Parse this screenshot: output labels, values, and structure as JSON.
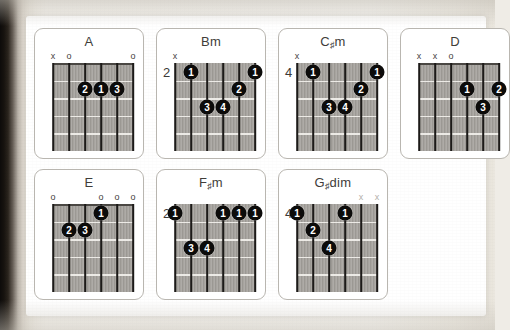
{
  "page": {
    "kind": "guitar-chord-chart-scan",
    "paper_color": "#fcfbf8",
    "ink_color": "#0c0b0a",
    "fretboard_color": "#a3a09b"
  },
  "chords": [
    {
      "id": "a",
      "name": "A",
      "root": "A",
      "accidental": "",
      "suffix": "",
      "start_fret": null,
      "start_fret_label": "",
      "frets": 5,
      "strings": 6,
      "open_markers": [
        {
          "string": 6,
          "symbol": "x",
          "faint": false
        },
        {
          "string": 5,
          "symbol": "o",
          "faint": false
        },
        {
          "string": 1,
          "symbol": "o",
          "faint": false
        }
      ],
      "fingers": [
        {
          "string": 4,
          "fret": 2,
          "finger": "2"
        },
        {
          "string": 3,
          "fret": 2,
          "finger": "1"
        },
        {
          "string": 2,
          "fret": 2,
          "finger": "3"
        }
      ]
    },
    {
      "id": "bm",
      "name": "Bm",
      "root": "B",
      "accidental": "",
      "suffix": "m",
      "start_fret": 2,
      "start_fret_label": "2",
      "frets": 5,
      "strings": 6,
      "open_markers": [
        {
          "string": 6,
          "symbol": "x",
          "faint": false
        }
      ],
      "fingers": [
        {
          "string": 5,
          "fret": 1,
          "finger": "1"
        },
        {
          "string": 1,
          "fret": 1,
          "finger": "1"
        },
        {
          "string": 2,
          "fret": 2,
          "finger": "2"
        },
        {
          "string": 4,
          "fret": 3,
          "finger": "3"
        },
        {
          "string": 3,
          "fret": 3,
          "finger": "4"
        }
      ]
    },
    {
      "id": "csharpm",
      "name": "C#m",
      "root": "C",
      "accidental": "♯",
      "suffix": "m",
      "start_fret": 4,
      "start_fret_label": "4",
      "frets": 5,
      "strings": 6,
      "open_markers": [
        {
          "string": 6,
          "symbol": "x",
          "faint": false
        }
      ],
      "fingers": [
        {
          "string": 5,
          "fret": 1,
          "finger": "1"
        },
        {
          "string": 1,
          "fret": 1,
          "finger": "1"
        },
        {
          "string": 2,
          "fret": 2,
          "finger": "2"
        },
        {
          "string": 4,
          "fret": 3,
          "finger": "3"
        },
        {
          "string": 3,
          "fret": 3,
          "finger": "4"
        }
      ]
    },
    {
      "id": "d",
      "name": "D",
      "root": "D",
      "accidental": "",
      "suffix": "",
      "start_fret": null,
      "start_fret_label": "",
      "frets": 5,
      "strings": 6,
      "open_markers": [
        {
          "string": 6,
          "symbol": "x",
          "faint": false
        },
        {
          "string": 5,
          "symbol": "x",
          "faint": false
        },
        {
          "string": 4,
          "symbol": "o",
          "faint": false
        }
      ],
      "fingers": [
        {
          "string": 3,
          "fret": 2,
          "finger": "1"
        },
        {
          "string": 1,
          "fret": 2,
          "finger": "2"
        },
        {
          "string": 2,
          "fret": 3,
          "finger": "3"
        }
      ]
    },
    {
      "id": "e",
      "name": "E",
      "root": "E",
      "accidental": "",
      "suffix": "",
      "start_fret": null,
      "start_fret_label": "",
      "frets": 5,
      "strings": 6,
      "open_markers": [
        {
          "string": 6,
          "symbol": "o",
          "faint": false
        },
        {
          "string": 3,
          "symbol": "o",
          "faint": false
        },
        {
          "string": 2,
          "symbol": "o",
          "faint": false
        },
        {
          "string": 1,
          "symbol": "o",
          "faint": false
        }
      ],
      "fingers": [
        {
          "string": 3,
          "fret": 1,
          "finger": "1"
        },
        {
          "string": 5,
          "fret": 2,
          "finger": "2"
        },
        {
          "string": 4,
          "fret": 2,
          "finger": "3"
        }
      ]
    },
    {
      "id": "fsharpm",
      "name": "F#m",
      "root": "F",
      "accidental": "♯",
      "suffix": "m",
      "start_fret": 2,
      "start_fret_label": "2",
      "frets": 5,
      "strings": 6,
      "open_markers": [],
      "fingers": [
        {
          "string": 6,
          "fret": 1,
          "finger": "1"
        },
        {
          "string": 3,
          "fret": 1,
          "finger": "1"
        },
        {
          "string": 2,
          "fret": 1,
          "finger": "1"
        },
        {
          "string": 1,
          "fret": 1,
          "finger": "1"
        },
        {
          "string": 5,
          "fret": 3,
          "finger": "3"
        },
        {
          "string": 4,
          "fret": 3,
          "finger": "4"
        }
      ]
    },
    {
      "id": "gsharpdim",
      "name": "G#dim",
      "root": "G",
      "accidental": "♯",
      "suffix": "dim",
      "start_fret": 4,
      "start_fret_label": "4",
      "frets": 5,
      "strings": 6,
      "open_markers": [
        {
          "string": 2,
          "symbol": "x",
          "faint": true
        },
        {
          "string": 1,
          "symbol": "x",
          "faint": true
        }
      ],
      "fingers": [
        {
          "string": 6,
          "fret": 1,
          "finger": "1"
        },
        {
          "string": 3,
          "fret": 1,
          "finger": "1"
        },
        {
          "string": 5,
          "fret": 2,
          "finger": "2"
        },
        {
          "string": 4,
          "fret": 3,
          "finger": "4"
        }
      ]
    }
  ],
  "layout": {
    "columns": 4,
    "rows": 2,
    "card_width": 110,
    "card_height": 131,
    "col_gap": 12,
    "row_gap": 10,
    "board_left": 18,
    "board_top": 34,
    "board_width": 80,
    "board_height": 88
  }
}
